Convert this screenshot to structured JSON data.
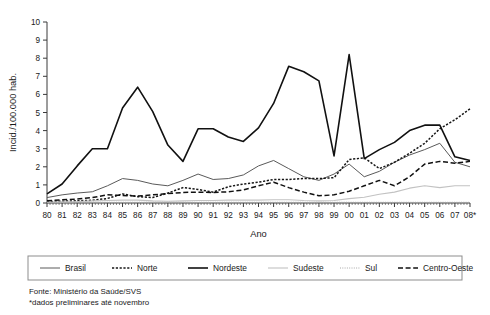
{
  "chart_data": {
    "type": "line",
    "title": "",
    "xlabel": "Ano",
    "ylabel": "Incid./100.000 hab.",
    "ylim": [
      0,
      10
    ],
    "ytick_labels": [
      "0",
      "1",
      "2",
      "3",
      "4",
      "5",
      "6",
      "7",
      "8",
      "9",
      "10"
    ],
    "grid": false,
    "legend_position": "bottom",
    "categories": [
      "80",
      "81",
      "82",
      "83",
      "84",
      "85",
      "86",
      "87",
      "88",
      "89",
      "90",
      "91",
      "92",
      "93",
      "94",
      "95",
      "96",
      "97",
      "98",
      "99",
      "00",
      "01",
      "02",
      "03",
      "04",
      "05",
      "06",
      "07",
      "08*"
    ],
    "series": [
      {
        "name": "Brasil",
        "style": "thin-solid",
        "color": "#5a5a5a",
        "values": [
          0.3,
          0.45,
          0.55,
          0.62,
          0.95,
          1.35,
          1.25,
          1.05,
          0.95,
          1.25,
          1.6,
          1.3,
          1.35,
          1.55,
          2.05,
          2.35,
          1.9,
          1.45,
          1.25,
          1.6,
          2.15,
          1.45,
          1.75,
          2.25,
          2.65,
          2.95,
          3.3,
          2.25,
          2.0
        ]
      },
      {
        "name": "Norte",
        "style": "dotted-dash",
        "color": "#161616",
        "values": [
          0.08,
          0.1,
          0.12,
          0.15,
          0.25,
          0.5,
          0.35,
          0.3,
          0.55,
          0.85,
          0.75,
          0.6,
          0.9,
          1.05,
          1.15,
          1.3,
          1.3,
          1.35,
          1.35,
          1.4,
          2.4,
          2.5,
          1.9,
          2.25,
          2.75,
          3.3,
          4.1,
          4.6,
          5.2
        ]
      },
      {
        "name": "Nordeste",
        "style": "thick-solid",
        "color": "#111111",
        "values": [
          0.5,
          1.05,
          2.05,
          3.0,
          3.0,
          5.25,
          6.4,
          5.05,
          3.2,
          2.3,
          4.1,
          4.1,
          3.65,
          3.4,
          4.15,
          5.5,
          7.55,
          7.25,
          6.75,
          2.6,
          8.2,
          2.45,
          2.95,
          3.35,
          4.0,
          4.3,
          4.3,
          2.55,
          2.35
        ]
      },
      {
        "name": "Sudeste",
        "style": "light-solid",
        "color": "#c2c2c2",
        "values": [
          0.05,
          0.06,
          0.08,
          0.12,
          0.14,
          0.16,
          0.16,
          0.12,
          0.1,
          0.12,
          0.14,
          0.14,
          0.16,
          0.16,
          0.16,
          0.18,
          0.18,
          0.14,
          0.12,
          0.14,
          0.24,
          0.32,
          0.48,
          0.6,
          0.82,
          0.95,
          0.85,
          0.95,
          0.95
        ]
      },
      {
        "name": "Sul",
        "style": "fine-dotted",
        "color": "#a8a8a8",
        "values": [
          0.03,
          0.03,
          0.03,
          0.04,
          0.04,
          0.04,
          0.04,
          0.04,
          0.04,
          0.04,
          0.04,
          0.04,
          0.04,
          0.04,
          0.04,
          0.04,
          0.04,
          0.04,
          0.04,
          0.04,
          0.04,
          0.04,
          0.04,
          0.04,
          0.04,
          0.04,
          0.04,
          0.04,
          0.04
        ]
      },
      {
        "name": "Centro-Oeste",
        "style": "dashed",
        "color": "#111111",
        "values": [
          0.12,
          0.18,
          0.22,
          0.3,
          0.45,
          0.42,
          0.38,
          0.45,
          0.52,
          0.58,
          0.6,
          0.58,
          0.62,
          0.72,
          0.95,
          1.15,
          0.85,
          0.6,
          0.4,
          0.45,
          0.65,
          0.95,
          1.25,
          0.95,
          1.45,
          2.15,
          2.3,
          2.2,
          2.3
        ]
      }
    ]
  },
  "axes": {
    "y_title": "Incid./100.000 hab.",
    "x_title": "Ano"
  },
  "legend": {
    "entries": [
      {
        "label": "Brasil"
      },
      {
        "label": "Norte"
      },
      {
        "label": "Nordeste"
      },
      {
        "label": "Sudeste"
      },
      {
        "label": "Sul"
      },
      {
        "label": "Centro-Oeste"
      }
    ]
  },
  "footnotes": {
    "source": "Fonte: Ministério da Saúde/SVS",
    "note": "*dados preliminares até novembro"
  }
}
